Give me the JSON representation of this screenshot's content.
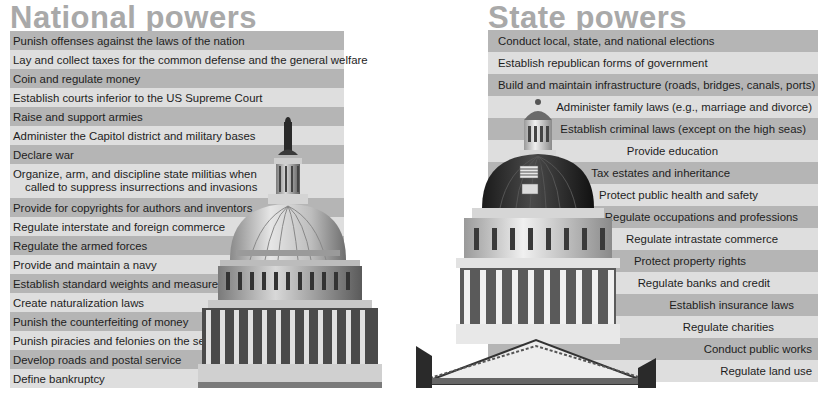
{
  "national": {
    "title": "National powers",
    "items": [
      {
        "label": "Punish offenses against the laws of the nation"
      },
      {
        "label": "Lay and collect taxes for the common defense and the general welfare"
      },
      {
        "label": "Coin and regulate money"
      },
      {
        "label": "Establish courts inferior to the US Supreme Court"
      },
      {
        "label": "Raise and support armies"
      },
      {
        "label": "Administer the Capitol district and military bases"
      },
      {
        "label": "Declare war"
      },
      {
        "label_line1": "Organize, arm, and discipline state militias when",
        "label_line2": "called to suppress insurrections and invasions"
      },
      {
        "label": "Provide for copyrights for authors and inventors"
      },
      {
        "label": "Regulate interstate and foreign commerce"
      },
      {
        "label": "Regulate the armed forces"
      },
      {
        "label": "Provide and maintain a navy"
      },
      {
        "label": "Establish standard weights and measures"
      },
      {
        "label": "Create naturalization laws"
      },
      {
        "label": "Punish the counterfeiting of money"
      },
      {
        "label": "Punish piracies and felonies on the seas"
      },
      {
        "label": "Develop roads and postal service"
      },
      {
        "label": "Define bankruptcy"
      }
    ],
    "image": "us-capitol-dome"
  },
  "state": {
    "title": "State powers",
    "items": [
      {
        "label": "Conduct local, state, and national elections"
      },
      {
        "label": "Establish republican forms of government"
      },
      {
        "label": "Build and maintain infrastructure (roads, bridges, canals, ports)"
      },
      {
        "label": "Administer family laws (e.g., marriage and divorce)"
      },
      {
        "label": "Establish criminal laws (except on the high seas)"
      },
      {
        "label": "Provide education"
      },
      {
        "label": "Tax estates and inheritance"
      },
      {
        "label": "Protect public health and safety"
      },
      {
        "label": "Regulate occupations and professions"
      },
      {
        "label": "Regulate intrastate commerce"
      },
      {
        "label": "Protect property rights"
      },
      {
        "label": "Regulate banks and credit"
      },
      {
        "label": "Establish insurance laws"
      },
      {
        "label": "Regulate charities"
      },
      {
        "label": "Conduct public works"
      },
      {
        "label": "Regulate land use"
      }
    ],
    "image": "state-capitol-dome"
  },
  "colors": {
    "stripe_dark": "#b5b5b5",
    "stripe_light": "#dedede",
    "title": "#a9a9a9",
    "text": "#1d1d1d"
  }
}
